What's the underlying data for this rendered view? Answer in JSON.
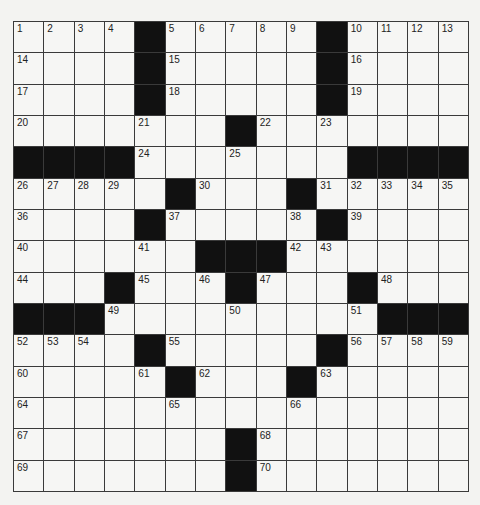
{
  "puzzle": {
    "rows": 15,
    "cols": 15,
    "grid": [
      [
        "1",
        "2",
        "3",
        "4",
        "#",
        "5",
        "6",
        "7",
        "8",
        "9",
        "#",
        "10",
        "11",
        "12",
        "13"
      ],
      [
        "14",
        ".",
        ".",
        ".",
        "#",
        "15",
        ".",
        ".",
        ".",
        ".",
        "#",
        "16",
        ".",
        ".",
        "."
      ],
      [
        "17",
        ".",
        ".",
        ".",
        "#",
        "18",
        ".",
        ".",
        ".",
        ".",
        "#",
        "19",
        ".",
        ".",
        "."
      ],
      [
        "20",
        ".",
        ".",
        ".",
        "21",
        ".",
        ".",
        "#",
        "22",
        ".",
        "23",
        ".",
        ".",
        ".",
        "."
      ],
      [
        "#",
        "#",
        "#",
        "#",
        "24",
        ".",
        ".",
        "25",
        ".",
        ".",
        ".",
        "#",
        "#",
        "#",
        "#"
      ],
      [
        "26",
        "27",
        "28",
        "29",
        ".",
        "#",
        "30",
        ".",
        ".",
        "#",
        "31",
        "32",
        "33",
        "34",
        "35"
      ],
      [
        "36",
        ".",
        ".",
        ".",
        "#",
        "37",
        ".",
        ".",
        ".",
        "38",
        "#",
        "39",
        ".",
        ".",
        "."
      ],
      [
        "40",
        ".",
        ".",
        ".",
        "41",
        ".",
        "#",
        "#",
        "#",
        "42",
        "43",
        ".",
        ".",
        ".",
        "."
      ],
      [
        "44",
        ".",
        ".",
        "#",
        "45",
        ".",
        "46",
        "#",
        "47",
        ".",
        ".",
        "#",
        "48",
        ".",
        "."
      ],
      [
        "#",
        "#",
        "#",
        "49",
        ".",
        ".",
        ".",
        "50",
        ".",
        ".",
        ".",
        "51",
        "#",
        "#",
        "#"
      ],
      [
        "52",
        "53",
        "54",
        ".",
        "#",
        "55",
        ".",
        ".",
        ".",
        ".",
        "#",
        "56",
        "57",
        "58",
        "59"
      ],
      [
        "60",
        ".",
        ".",
        ".",
        "61",
        "#",
        "62",
        ".",
        ".",
        "#",
        "63",
        ".",
        ".",
        ".",
        "."
      ],
      [
        "64",
        ".",
        ".",
        ".",
        ".",
        "65",
        ".",
        ".",
        ".",
        "66",
        ".",
        ".",
        ".",
        ".",
        "."
      ],
      [
        "67",
        ".",
        ".",
        ".",
        ".",
        ".",
        ".",
        "#",
        "68",
        ".",
        ".",
        ".",
        ".",
        ".",
        "."
      ],
      [
        "69",
        ".",
        ".",
        ".",
        ".",
        ".",
        ".",
        "#",
        "70",
        ".",
        ".",
        ".",
        ".",
        ".",
        "."
      ]
    ]
  },
  "colors": {
    "black_cell": "#111111",
    "white_cell": "#f6f6f4",
    "grid_line": "#3a3a3a",
    "page_background": "#f3f3f1"
  }
}
